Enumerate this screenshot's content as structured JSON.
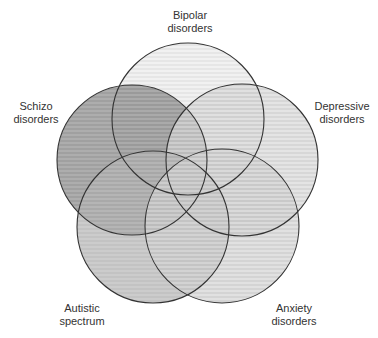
{
  "diagram": {
    "type": "venn",
    "sets": [
      {
        "id": "bipolar",
        "line1": "Bipolar",
        "line2": "disorders",
        "cx": 188,
        "cy": 119,
        "r": 76,
        "fill": "#ececec",
        "stripe": "#dcdcdc",
        "label_x": 190,
        "label_y": 9
      },
      {
        "id": "schizo",
        "line1": "Schizo",
        "line2": "disorders",
        "cx": 132,
        "cy": 160,
        "r": 75,
        "fill": "#8e8e8e",
        "stripe": "#7c7c7c",
        "label_x": 36,
        "label_y": 100
      },
      {
        "id": "depressive",
        "line1": "Depressive",
        "line2": "disorders",
        "cx": 242,
        "cy": 160,
        "r": 76,
        "fill": "#dadada",
        "stripe": "#c8c8c8",
        "label_x": 342,
        "label_y": 100
      },
      {
        "id": "autistic",
        "line1": "Autistic",
        "line2": "spectrum",
        "cx": 153,
        "cy": 227,
        "r": 76,
        "fill": "#b8b8b8",
        "stripe": "#acacac",
        "label_x": 82,
        "label_y": 302
      },
      {
        "id": "anxiety",
        "line1": "Anxiety",
        "line2": "disorders",
        "cx": 222,
        "cy": 226,
        "r": 77,
        "fill": "#d6d6d6",
        "stripe": "#c4c4c4",
        "label_x": 294,
        "label_y": 302
      }
    ],
    "stroke": "#333333"
  }
}
